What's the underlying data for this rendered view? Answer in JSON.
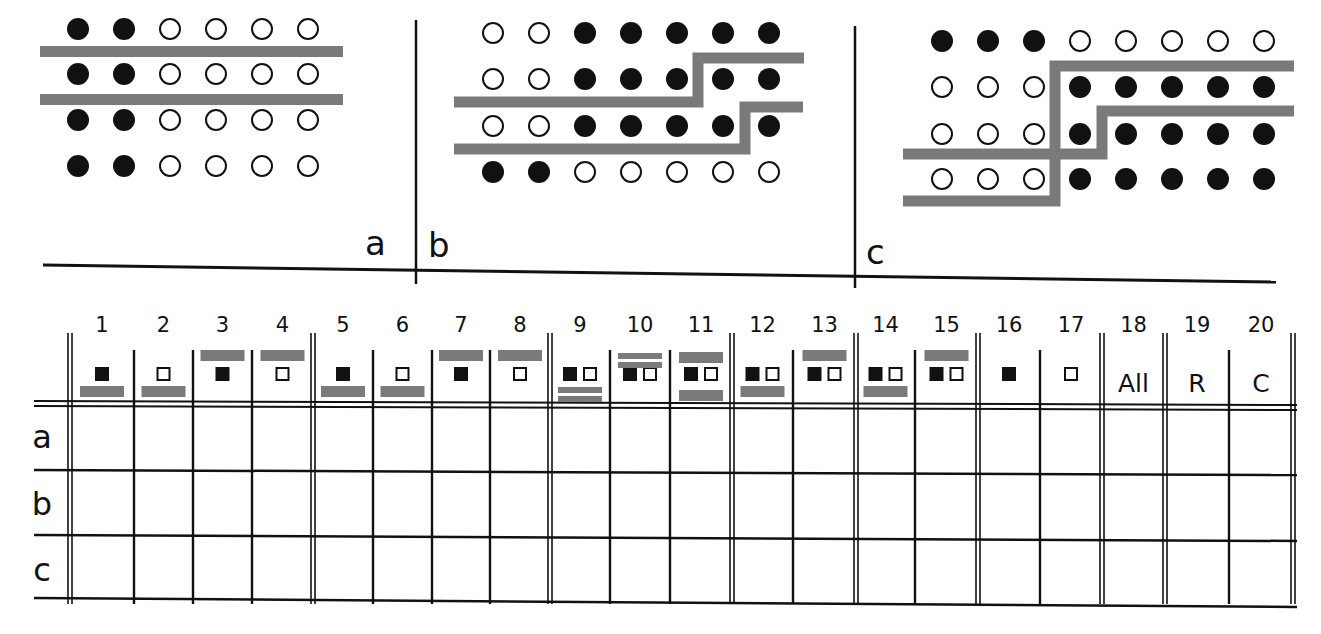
{
  "colors": {
    "ink": "#111111",
    "bar": "#7a7a7a",
    "paper": "#ffffff"
  },
  "panels": [
    {
      "label": "a",
      "rows": [
        [
          1,
          1,
          0,
          0,
          0,
          0
        ],
        [
          1,
          1,
          0,
          0,
          0,
          0
        ],
        [
          1,
          1,
          0,
          0,
          0,
          0
        ],
        [
          1,
          1,
          0,
          0,
          0,
          0
        ]
      ],
      "bars": "two horizontal bars between rows 1-2 and 2-3"
    },
    {
      "label": "b",
      "rows": [
        [
          0,
          0,
          1,
          1,
          1,
          1,
          1
        ],
        [
          0,
          0,
          1,
          1,
          1,
          1,
          1
        ],
        [
          0,
          0,
          1,
          1,
          1,
          1,
          1
        ],
        [
          1,
          1,
          0,
          0,
          0,
          0,
          0
        ]
      ],
      "bars": "two stepped bars bordering regions"
    },
    {
      "label": "c",
      "rows": [
        [
          1,
          1,
          1,
          0,
          0,
          0,
          0,
          0
        ],
        [
          0,
          0,
          0,
          1,
          1,
          1,
          1,
          1
        ],
        [
          0,
          0,
          0,
          1,
          1,
          1,
          1,
          1
        ],
        [
          0,
          0,
          0,
          1,
          1,
          1,
          1,
          1
        ]
      ],
      "bars": "two crossing stepped bars"
    }
  ],
  "table": {
    "columns": [
      {
        "num": "1",
        "symbol": "filled",
        "bar": "below"
      },
      {
        "num": "2",
        "symbol": "open",
        "bar": "below"
      },
      {
        "num": "3",
        "symbol": "filled",
        "bar": "above"
      },
      {
        "num": "4",
        "symbol": "open",
        "bar": "above"
      },
      {
        "num": "5",
        "symbol": "filled",
        "bar": "below"
      },
      {
        "num": "6",
        "symbol": "open",
        "bar": "below"
      },
      {
        "num": "7",
        "symbol": "filled",
        "bar": "above"
      },
      {
        "num": "8",
        "symbol": "open",
        "bar": "above"
      },
      {
        "num": "9",
        "symbol": "both",
        "bar": "double-below"
      },
      {
        "num": "10",
        "symbol": "both",
        "bar": "double-above"
      },
      {
        "num": "11",
        "symbol": "both",
        "bar": "above-and-below"
      },
      {
        "num": "12",
        "symbol": "both",
        "bar": "below"
      },
      {
        "num": "13",
        "symbol": "both",
        "bar": "above"
      },
      {
        "num": "14",
        "symbol": "both",
        "bar": "below"
      },
      {
        "num": "15",
        "symbol": "both",
        "bar": "above"
      },
      {
        "num": "16",
        "symbol": "filled",
        "bar": "none"
      },
      {
        "num": "17",
        "symbol": "open",
        "bar": "none"
      },
      {
        "num": "18",
        "symbol": "text",
        "text": "All",
        "bar": "none"
      },
      {
        "num": "19",
        "symbol": "text",
        "text": "R",
        "bar": "none"
      },
      {
        "num": "20",
        "symbol": "text",
        "text": "C",
        "bar": "none"
      }
    ],
    "row_labels": [
      "a",
      "b",
      "c"
    ]
  }
}
